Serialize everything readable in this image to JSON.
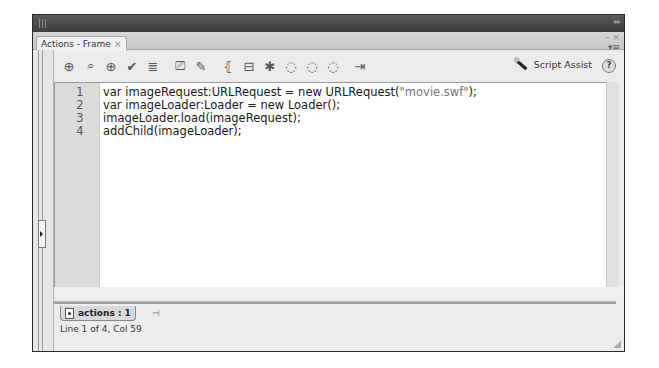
{
  "panel": {
    "title_tab": "Actions - Frame",
    "tab_close": "×",
    "collapse_glyph": "▸▸",
    "minimize_glyph": "–",
    "close_glyph": "×",
    "menu_glyph": "▾≡"
  },
  "toolbar": {
    "icons": [
      {
        "name": "add-statement-icon",
        "glyph": "⊕"
      },
      {
        "name": "find-icon",
        "glyph": "⌕"
      },
      {
        "name": "insert-target-path-icon",
        "glyph": "⊕"
      },
      {
        "name": "check-syntax-icon",
        "glyph": "✔"
      },
      {
        "name": "auto-format-icon",
        "glyph": "≣"
      },
      {
        "name": "show-code-hint-icon",
        "glyph": "⎚"
      },
      {
        "name": "debug-options-icon",
        "glyph": "✎"
      },
      {
        "name": "collapse-between-braces-icon",
        "glyph": "⦃"
      },
      {
        "name": "collapse-selection-icon",
        "glyph": "⊟"
      },
      {
        "name": "expand-all-icon",
        "glyph": "✱"
      },
      {
        "name": "apply-block-comment-icon",
        "glyph": "◌"
      },
      {
        "name": "apply-line-comment-icon",
        "glyph": "◌"
      },
      {
        "name": "remove-comment-icon",
        "glyph": "◌"
      },
      {
        "name": "show-hide-toolbox-icon",
        "glyph": "⇥"
      }
    ],
    "script_assist_label": "Script Assist",
    "help_glyph": "?"
  },
  "editor": {
    "line_numbers": [
      "1",
      "2",
      "3",
      "4"
    ],
    "lines": [
      {
        "before": "var imageRequest:URLRequest = new URLRequest(",
        "string": "\"movie.swf\"",
        "after": ");"
      },
      {
        "before": "var imageLoader:Loader = new Loader();",
        "string": "",
        "after": ""
      },
      {
        "before": "imageLoader.load(imageRequest);",
        "string": "",
        "after": ""
      },
      {
        "before": "addChild(imageLoader);",
        "string": "",
        "after": ""
      }
    ]
  },
  "script_navigator": {
    "tab_label": "actions : 1",
    "pin_glyph": "⊣"
  },
  "status_bar": {
    "text": "Line 1 of 4, Col 59"
  }
}
